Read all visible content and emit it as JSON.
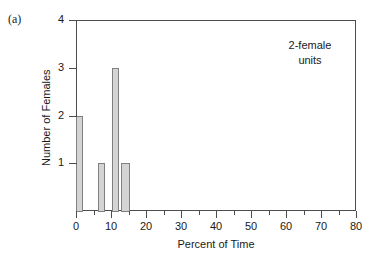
{
  "panel": {
    "label": "(a)"
  },
  "annotation": {
    "line1": "2-female",
    "line2": "units"
  },
  "chart_data": {
    "type": "bar",
    "title": "",
    "subtitle": "",
    "xlabel": "Percent of Time",
    "ylabel": "Number of Females",
    "xlim": [
      0,
      80
    ],
    "ylim": [
      0,
      4
    ],
    "grid": false,
    "legend": null,
    "annotations": [
      "2-female units",
      "(a)"
    ],
    "xticks": [
      0,
      10,
      20,
      30,
      40,
      50,
      60,
      70,
      80
    ],
    "xtick_labels": [
      "0",
      "10",
      "20",
      "30",
      "40",
      "50",
      "60",
      "70",
      "80"
    ],
    "xminor_ticks": [
      5,
      15,
      25,
      35,
      45,
      55,
      65,
      75
    ],
    "yticks": [
      1,
      2,
      3,
      4
    ],
    "ytick_labels": [
      "1",
      "2",
      "3",
      "4"
    ],
    "bar_color": "#d4d4d4",
    "bar_edge_color": "#808080",
    "axis_color": "#4d4d4d",
    "bars": [
      {
        "x_start": 0.0,
        "x_end": 2.0,
        "value": 2
      },
      {
        "x_start": 6.2,
        "x_end": 8.2,
        "value": 1
      },
      {
        "x_start": 10.3,
        "x_end": 12.3,
        "value": 3
      },
      {
        "x_start": 12.8,
        "x_end": 15.4,
        "value": 1
      }
    ]
  }
}
